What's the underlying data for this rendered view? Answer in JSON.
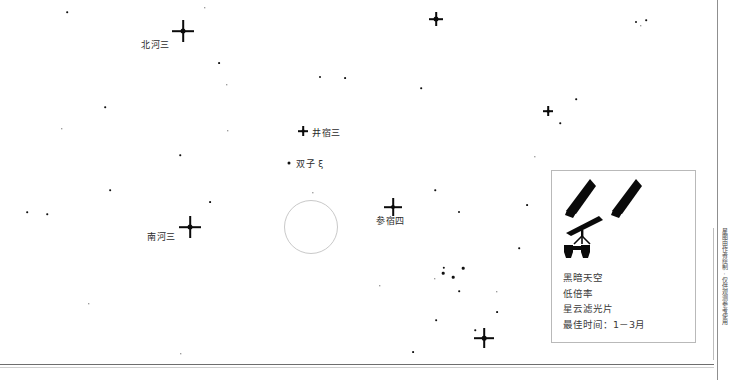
{
  "chart_data": {
    "type": "scatter",
    "title": "",
    "xlabel": "",
    "ylabel": "",
    "xlim": [
      0,
      714
    ],
    "ylim": [
      0,
      366
    ],
    "grid": false,
    "legend_position": "bottom-right",
    "labeled_stars": [
      {
        "label": "北河三",
        "x": 183,
        "y": 31,
        "mag_size": 9,
        "label_x": 141,
        "label_y": 38
      },
      {
        "label": "井宿三",
        "x": 303,
        "y": 131,
        "mag_size": 6,
        "label_x": 312,
        "label_y": 126
      },
      {
        "label": "双子 ξ",
        "x": 289,
        "y": 163,
        "mag_size": 3,
        "label_x": 296,
        "label_y": 157
      },
      {
        "label": "南河三",
        "x": 190,
        "y": 227,
        "mag_size": 9,
        "label_x": 147,
        "label_y": 230
      },
      {
        "label": "参宿四",
        "x": 393,
        "y": 207,
        "mag_size": 8,
        "label_x": 376,
        "label_y": 214
      }
    ],
    "field_stars": [
      {
        "x": 205,
        "y": 8,
        "size": 1.4
      },
      {
        "x": 67,
        "y": 12,
        "size": 1.6
      },
      {
        "x": 219,
        "y": 63,
        "size": 1.8
      },
      {
        "x": 227,
        "y": 85,
        "size": 1.4
      },
      {
        "x": 105,
        "y": 107,
        "size": 1.6
      },
      {
        "x": 62,
        "y": 129,
        "size": 1.4
      },
      {
        "x": 228,
        "y": 131,
        "size": 1.4
      },
      {
        "x": 180,
        "y": 155,
        "size": 1.5
      },
      {
        "x": 27,
        "y": 212,
        "size": 1.6
      },
      {
        "x": 47,
        "y": 214,
        "size": 1.5
      },
      {
        "x": 110,
        "y": 190,
        "size": 1.7
      },
      {
        "x": 210,
        "y": 202,
        "size": 1.8
      },
      {
        "x": 89,
        "y": 304,
        "size": 1.4
      },
      {
        "x": 181,
        "y": 354,
        "size": 1.4
      },
      {
        "x": 320,
        "y": 77,
        "size": 2.0
      },
      {
        "x": 345,
        "y": 78,
        "size": 1.8
      },
      {
        "x": 436,
        "y": 19,
        "size": 5.0
      },
      {
        "x": 636,
        "y": 22,
        "size": 2.0
      },
      {
        "x": 646,
        "y": 20,
        "size": 1.6
      },
      {
        "x": 641,
        "y": 26,
        "size": 1.4
      },
      {
        "x": 421,
        "y": 88,
        "size": 1.6
      },
      {
        "x": 548,
        "y": 111,
        "size": 2.2
      },
      {
        "x": 576,
        "y": 99,
        "size": 1.6
      },
      {
        "x": 560,
        "y": 123,
        "size": 1.5
      },
      {
        "x": 435,
        "y": 190,
        "size": 1.5
      },
      {
        "x": 459,
        "y": 212,
        "size": 2.0
      },
      {
        "x": 527,
        "y": 205,
        "size": 1.8
      },
      {
        "x": 519,
        "y": 248,
        "size": 1.6
      },
      {
        "x": 443,
        "y": 273,
        "size": 2.6
      },
      {
        "x": 435,
        "y": 279,
        "size": 1.4
      },
      {
        "x": 453,
        "y": 277,
        "size": 2.6
      },
      {
        "x": 444,
        "y": 268,
        "size": 2.4
      },
      {
        "x": 463,
        "y": 268,
        "size": 2.6
      },
      {
        "x": 459,
        "y": 291,
        "size": 1.6
      },
      {
        "x": 497,
        "y": 292,
        "size": 1.4
      },
      {
        "x": 436,
        "y": 320,
        "size": 1.7
      },
      {
        "x": 497,
        "y": 312,
        "size": 1.8
      },
      {
        "x": 475,
        "y": 330,
        "size": 1.5
      },
      {
        "x": 413,
        "y": 352,
        "size": 1.8
      },
      {
        "x": 380,
        "y": 286,
        "size": 1.4
      },
      {
        "x": 535,
        "y": 157,
        "size": 1.3
      },
      {
        "x": 313,
        "y": 193,
        "size": 1.3
      }
    ],
    "bright_stars": [
      {
        "x": 183,
        "y": 31,
        "ray": 11,
        "core": 5.0
      },
      {
        "x": 190,
        "y": 227,
        "ray": 11,
        "core": 5.0
      },
      {
        "x": 393,
        "y": 207,
        "ray": 9,
        "core": 4.2
      },
      {
        "x": 436,
        "y": 19,
        "ray": 7,
        "core": 3.6
      },
      {
        "x": 303,
        "y": 131,
        "ray": 5,
        "core": 2.8
      },
      {
        "x": 484,
        "y": 338,
        "ray": 10,
        "core": 4.6
      },
      {
        "x": 548,
        "y": 111,
        "ray": 5,
        "core": 2.6
      }
    ],
    "deep_sky_object": {
      "x": 311,
      "y": 227,
      "radius": 26,
      "shape": "circle",
      "stroke": "#c9c9c9"
    }
  },
  "legend": {
    "icons": [
      {
        "name": "naked-eye-icon-left"
      },
      {
        "name": "naked-eye-icon-right"
      },
      {
        "name": "telescope-icon"
      },
      {
        "name": "binoculars-icon"
      }
    ],
    "lines": [
      "黑暗天空",
      "低倍率",
      "星云滤光片",
      "最佳时间：1－3月"
    ]
  },
  "margin": {
    "vertical_caption": "星图由作者绘制·仅供观测参考使用"
  },
  "colors": {
    "star": "#111111",
    "label_text": "#2b2b2b",
    "legend_border": "#b9b9b9",
    "legend_text": "#3a3a3a",
    "dso_circle": "#c9c9c9",
    "rule": "#6e6e6e",
    "background": "#ffffff"
  }
}
